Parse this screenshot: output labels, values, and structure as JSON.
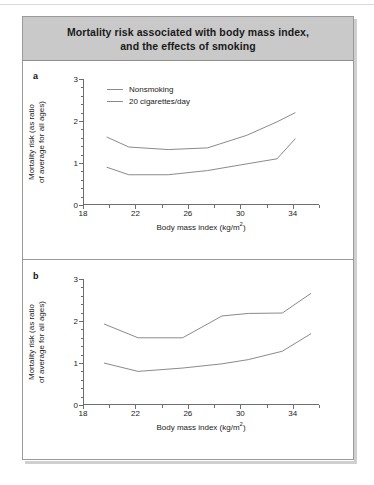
{
  "figure": {
    "title": "Mortality risk associated with body mass index, and the effects of smoking",
    "title_line1": "Mortality risk associated with body mass index,",
    "title_line2": "and the effects of smoking",
    "title_band_color": "#c9c9c9",
    "border_color": "#9a9a9a",
    "line_color": "#8a8a8a"
  },
  "panels": [
    {
      "label": "a",
      "legend_visible": true
    },
    {
      "label": "b",
      "legend_visible": false
    }
  ],
  "legend": {
    "entries": [
      {
        "label": "Nonsmoking",
        "color": "#8a8a8a"
      },
      {
        "label": "20 cigarettes/day",
        "color": "#8a8a8a"
      }
    ]
  },
  "axes": {
    "ylabel_line1": "Mortality risk (as ratio",
    "ylabel_line2": "of average for all ages)",
    "xlabel": "Body mass index (kg/m2)",
    "xlabel_base": "Body mass index (kg/m",
    "xlabel_sup": "2",
    "xlabel_tail": ")",
    "y_ticks": [
      0,
      1,
      2,
      3
    ],
    "x_ticks": [
      18,
      22,
      26,
      30,
      34
    ],
    "ylim": [
      0,
      3
    ],
    "xlim": [
      18,
      36
    ]
  },
  "chart_data": [
    {
      "type": "line",
      "panel": "a",
      "title": "Mortality risk associated with body mass index, and the effects of smoking",
      "xlabel": "Body mass index (kg/m2)",
      "ylabel": "Mortality risk (as ratio of average for all ages)",
      "xlim": [
        18,
        36
      ],
      "ylim": [
        0,
        3
      ],
      "xticks": [
        18,
        22,
        26,
        30,
        34
      ],
      "yticks": [
        0,
        1,
        2,
        3
      ],
      "grid": false,
      "legend_position": "top-left",
      "series": [
        {
          "name": "20 cigarettes/day",
          "x": [
            19.8,
            21.5,
            24.5,
            27.5,
            30.5,
            32.8,
            34.2
          ],
          "values": [
            1.62,
            1.38,
            1.32,
            1.36,
            1.66,
            1.98,
            2.2
          ]
        },
        {
          "name": "Nonsmoking",
          "x": [
            19.8,
            21.5,
            24.5,
            27.5,
            30.5,
            32.8,
            34.2
          ],
          "values": [
            0.9,
            0.72,
            0.72,
            0.82,
            0.98,
            1.1,
            1.58
          ]
        }
      ]
    },
    {
      "type": "line",
      "panel": "b",
      "xlabel": "Body mass index (kg/m2)",
      "ylabel": "Mortality risk (as ratio of average for all ages)",
      "xlim": [
        18,
        36
      ],
      "ylim": [
        0,
        3
      ],
      "xticks": [
        18,
        22,
        26,
        30,
        34
      ],
      "yticks": [
        0,
        1,
        2,
        3
      ],
      "grid": false,
      "legend_position": "none",
      "series": [
        {
          "name": "20 cigarettes/day",
          "x": [
            19.6,
            22.2,
            25.6,
            28.6,
            30.6,
            33.2,
            35.4
          ],
          "values": [
            1.93,
            1.6,
            1.6,
            2.12,
            2.18,
            2.19,
            2.66
          ]
        },
        {
          "name": "Nonsmoking",
          "x": [
            19.6,
            22.2,
            25.6,
            28.6,
            30.6,
            33.2,
            35.4
          ],
          "values": [
            1.0,
            0.8,
            0.88,
            0.98,
            1.08,
            1.28,
            1.7
          ]
        }
      ]
    }
  ]
}
